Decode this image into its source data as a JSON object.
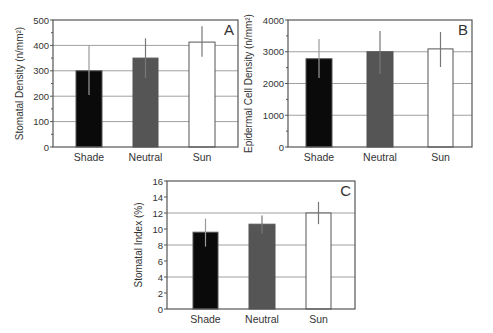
{
  "chart_data": [
    {
      "panel": "A",
      "type": "bar",
      "title": "",
      "panel_label": "A",
      "categories": [
        "Shade",
        "Neutral",
        "Sun"
      ],
      "values": [
        300,
        350,
        413
      ],
      "error_low": [
        205,
        272,
        355
      ],
      "error_high": [
        400,
        428,
        475
      ],
      "colors": [
        "#0a0a0a",
        "#555555",
        "#ffffff"
      ],
      "xlabel": "",
      "ylabel": "Stomatal Density (n/mm²)",
      "ylim": [
        0,
        500
      ],
      "yticks": [
        0,
        100,
        200,
        300,
        400,
        500
      ],
      "gridlines": [
        100,
        200,
        300,
        400
      ],
      "grid": true,
      "legend": null,
      "box": {
        "x0": 53,
        "x1": 238,
        "y0": 20,
        "y1": 147
      },
      "bars_x": [
        [
          76,
          102
        ],
        [
          133,
          158
        ],
        [
          189,
          215
        ]
      ]
    },
    {
      "panel": "B",
      "type": "bar",
      "title": "",
      "panel_label": "B",
      "categories": [
        "Shade",
        "Neutral",
        "Sun"
      ],
      "values": [
        2780,
        3000,
        3090
      ],
      "error_low": [
        2170,
        2300,
        2520
      ],
      "error_high": [
        3400,
        3650,
        3620
      ],
      "colors": [
        "#0a0a0a",
        "#555555",
        "#ffffff"
      ],
      "xlabel": "",
      "ylabel": "Epidermal Cell Density (n/mm²)",
      "ylim": [
        0,
        4000
      ],
      "yticks": [
        0,
        1000,
        2000,
        3000,
        4000
      ],
      "gridlines": [
        1000,
        2000,
        3000
      ],
      "grid": true,
      "legend": null,
      "box": {
        "x0": 288,
        "x1": 472,
        "y0": 20,
        "y1": 147
      },
      "bars_x": [
        [
          306,
          332
        ],
        [
          367,
          393
        ],
        [
          428,
          453
        ]
      ]
    },
    {
      "panel": "C",
      "type": "bar",
      "title": "",
      "panel_label": "C",
      "categories": [
        "Shade",
        "Neutral",
        "Sun"
      ],
      "values": [
        9.6,
        10.6,
        12.0
      ],
      "error_low": [
        7.8,
        9.4,
        10.6
      ],
      "error_high": [
        11.3,
        11.7,
        13.4
      ],
      "colors": [
        "#0a0a0a",
        "#555555",
        "#ffffff"
      ],
      "xlabel": "",
      "ylabel": "Stomatal Index (%)",
      "ylim": [
        0,
        16
      ],
      "yticks": [
        0,
        2,
        4,
        6,
        8,
        10,
        12,
        14,
        16
      ],
      "gridlines": [
        4,
        8,
        12
      ],
      "grid": true,
      "legend": null,
      "box": {
        "x0": 167,
        "x1": 355,
        "y0": 181,
        "y1": 309
      },
      "bars_x": [
        [
          193,
          218
        ],
        [
          249,
          275
        ],
        [
          306,
          331
        ]
      ]
    }
  ],
  "style": {
    "axis_color": "#555555",
    "grid_color": "#a0a0a0",
    "error_bar_color": "#777777",
    "text_color": "#333333"
  }
}
